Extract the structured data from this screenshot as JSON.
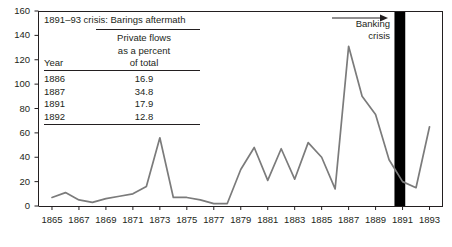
{
  "chart_data": {
    "type": "line",
    "title": "",
    "subtitle": "",
    "xlabel": "",
    "ylabel": "",
    "xlim": [
      1864,
      1894
    ],
    "ylim": [
      0,
      160
    ],
    "ytick_step": 20,
    "xtick_step": 2,
    "grid": false,
    "legend_position": "none",
    "line_color": "#7b7b7b",
    "axis_color": "#231f20",
    "yticks": [
      "0",
      "20",
      "40",
      "60",
      "80",
      "100",
      "120",
      "140",
      "160"
    ],
    "ytick_values": [
      0,
      20,
      40,
      60,
      80,
      100,
      120,
      140,
      160
    ],
    "xticks": [
      "1865",
      "1867",
      "1869",
      "1871",
      "1873",
      "1875",
      "1877",
      "1879",
      "1881",
      "1883",
      "1885",
      "1887",
      "1889",
      "1891",
      "1893"
    ],
    "xtick_values": [
      1865,
      1867,
      1869,
      1871,
      1873,
      1875,
      1877,
      1879,
      1881,
      1883,
      1885,
      1887,
      1889,
      1891,
      1893
    ],
    "x": [
      1865,
      1866,
      1867,
      1868,
      1869,
      1870,
      1871,
      1872,
      1873,
      1874,
      1875,
      1876,
      1877,
      1878,
      1879,
      1880,
      1881,
      1882,
      1883,
      1884,
      1885,
      1886,
      1887,
      1888,
      1889,
      1890,
      1891,
      1892,
      1893
    ],
    "series": [
      {
        "name": "Capital flows",
        "values": [
          7,
          11,
          5,
          3,
          6,
          8,
          10,
          16,
          56,
          7,
          7,
          5,
          2,
          2,
          30,
          48,
          21,
          47,
          22,
          52,
          40,
          14,
          131,
          90,
          75,
          38,
          20,
          15,
          65
        ]
      }
    ],
    "annotations": [
      {
        "name": "banking-crisis-band",
        "type": "vband",
        "x_start": 1890.4,
        "x_end": 1891.2,
        "color": "#000000"
      },
      {
        "name": "banking-crisis-label",
        "type": "text-with-arrow",
        "line1": "Banking",
        "line2": "crisis",
        "arrow_direction": "right"
      }
    ]
  },
  "inset_table": {
    "title": "1891–93 crisis: Barings aftermath",
    "header": {
      "year_col": "Year",
      "value_col_line1": "Private flows",
      "value_col_line2": "as a percent",
      "value_col_line3": "of total"
    },
    "rows": [
      {
        "year": "1886",
        "value": "16.9"
      },
      {
        "year": "1887",
        "value": "34.8"
      },
      {
        "year": "1891",
        "value": "17.9"
      },
      {
        "year": "1892",
        "value": "12.8"
      }
    ]
  },
  "banking_annotation": {
    "line1": "Banking",
    "line2": "crisis"
  }
}
